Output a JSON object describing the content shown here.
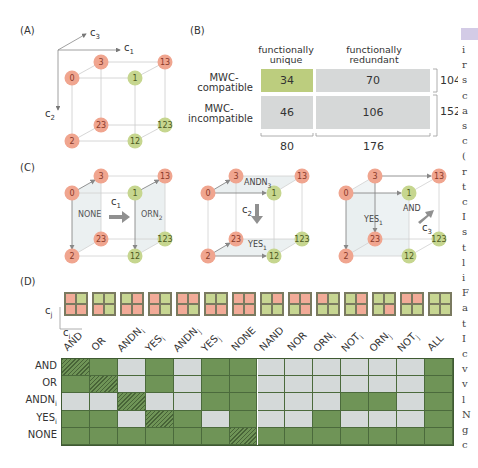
{
  "panels": {
    "A": {
      "label": "(A)",
      "axes": {
        "c1": "c",
        "c1_sub": "1",
        "c2": "c",
        "c2_sub": "2",
        "c3": "c",
        "c3_sub": "3"
      },
      "nodes": [
        {
          "id": "0",
          "color": "red"
        },
        {
          "id": "3",
          "color": "red"
        },
        {
          "id": "13",
          "color": "red"
        },
        {
          "id": "1",
          "color": "green"
        },
        {
          "id": "23",
          "color": "red"
        },
        {
          "id": "123",
          "color": "green"
        },
        {
          "id": "2",
          "color": "red"
        },
        {
          "id": "12",
          "color": "green"
        }
      ]
    },
    "B": {
      "label": "(B)",
      "col_headers": [
        "functionally unique",
        "functionally redundant"
      ],
      "col_header_lines": [
        [
          "functionally",
          "unique"
        ],
        [
          "functionally",
          "redundant"
        ]
      ],
      "row_headers": [
        [
          "MWC-",
          "compatible"
        ],
        [
          "MWC-",
          "incompatible"
        ]
      ],
      "cells": [
        [
          "34",
          "70"
        ],
        [
          "46",
          "106"
        ]
      ],
      "row_totals": [
        "104",
        "152"
      ],
      "col_totals": [
        "80",
        "176"
      ]
    },
    "C": {
      "label": "(C)",
      "cube1": {
        "left_label": "NONE",
        "right_label": "ORN",
        "right_sub": "2",
        "arrow_label": "c",
        "arrow_sub": "1"
      },
      "cube2": {
        "top_label": "ANDN",
        "top_sub": "3",
        "bottom_label": "YES",
        "bottom_sub": "1",
        "arrow_label": "c",
        "arrow_sub": "2"
      },
      "cube3": {
        "left_label": "YES",
        "left_sub": "1",
        "right_label": "AND",
        "arrow_label": "c",
        "arrow_sub": "3"
      }
    },
    "D": {
      "label": "(D)",
      "axis_j": "c",
      "axis_j_sub": "j",
      "axis_i": "c",
      "axis_i_sub": "i",
      "columns": [
        {
          "name": "AND",
          "sub": "",
          "quad": [
            "r",
            "g",
            "r",
            "r"
          ]
        },
        {
          "name": "OR",
          "sub": "",
          "quad": [
            "g",
            "g",
            "r",
            "g"
          ]
        },
        {
          "name": "ANDN",
          "sub": "i",
          "quad": [
            "g",
            "r",
            "r",
            "r"
          ]
        },
        {
          "name": "YES",
          "sub": "i",
          "quad": [
            "r",
            "g",
            "r",
            "g"
          ]
        },
        {
          "name": "ANDN",
          "sub": "j",
          "quad": [
            "r",
            "r",
            "r",
            "g"
          ]
        },
        {
          "name": "YES",
          "sub": "j",
          "quad": [
            "g",
            "g",
            "r",
            "r"
          ]
        },
        {
          "name": "NONE",
          "sub": "",
          "quad": [
            "r",
            "r",
            "r",
            "r"
          ]
        },
        {
          "name": "NAND",
          "sub": "",
          "quad": [
            "g",
            "r",
            "g",
            "g"
          ]
        },
        {
          "name": "NOR",
          "sub": "",
          "quad": [
            "r",
            "r",
            "g",
            "r"
          ]
        },
        {
          "name": "ORN",
          "sub": "i",
          "quad": [
            "r",
            "g",
            "g",
            "g"
          ]
        },
        {
          "name": "NOT",
          "sub": "i",
          "quad": [
            "g",
            "r",
            "g",
            "r"
          ]
        },
        {
          "name": "ORN",
          "sub": "j",
          "quad": [
            "g",
            "g",
            "g",
            "r"
          ]
        },
        {
          "name": "NOT",
          "sub": "j",
          "quad": [
            "r",
            "r",
            "g",
            "g"
          ]
        },
        {
          "name": "ALL",
          "sub": "",
          "quad": [
            "g",
            "g",
            "g",
            "g"
          ]
        }
      ],
      "rows": [
        {
          "name": "AND",
          "sub": "",
          "cells": [
            "h",
            "G",
            "L",
            "G",
            "L",
            "G",
            "G",
            "L",
            "L",
            "L",
            "L",
            "L",
            "L",
            "G"
          ]
        },
        {
          "name": "OR",
          "sub": "",
          "cells": [
            "G",
            "h",
            "L",
            "G",
            "L",
            "G",
            "G",
            "L",
            "L",
            "L",
            "L",
            "L",
            "L",
            "G"
          ]
        },
        {
          "name": "ANDN",
          "sub": "i",
          "cells": [
            "L",
            "L",
            "h",
            "L",
            "L",
            "G",
            "G",
            "L",
            "L",
            "L",
            "G",
            "G",
            "L",
            "G"
          ]
        },
        {
          "name": "YES",
          "sub": "i",
          "cells": [
            "G",
            "G",
            "L",
            "h",
            "G",
            "L",
            "G",
            "L",
            "L",
            "G",
            "L",
            "L",
            "L",
            "G"
          ]
        },
        {
          "name": "NONE",
          "sub": "",
          "cells": [
            "G",
            "G",
            "G",
            "G",
            "G",
            "G",
            "h",
            "G",
            "G",
            "G",
            "G",
            "G",
            "G",
            "G"
          ]
        }
      ]
    }
  },
  "side_text": {
    "chars": [
      "i",
      "r",
      "s",
      "c",
      "a",
      "s",
      "c",
      "(",
      "r",
      "t",
      "c",
      "I",
      "s",
      "t",
      "l",
      "i",
      "F",
      "a",
      "t",
      "I",
      "c",
      "v",
      "v",
      "l",
      "N",
      "g",
      "c"
    ]
  },
  "colors": {
    "node_red": "#f0a58f",
    "node_green": "#c6d68f",
    "quad_red": "#f2ab98",
    "quad_green": "#c7d692",
    "cell_green": "#6f9457",
    "cell_light": "#d4d9d9",
    "table_green": "#bccd7e",
    "table_gray": "#d6d8d8"
  }
}
